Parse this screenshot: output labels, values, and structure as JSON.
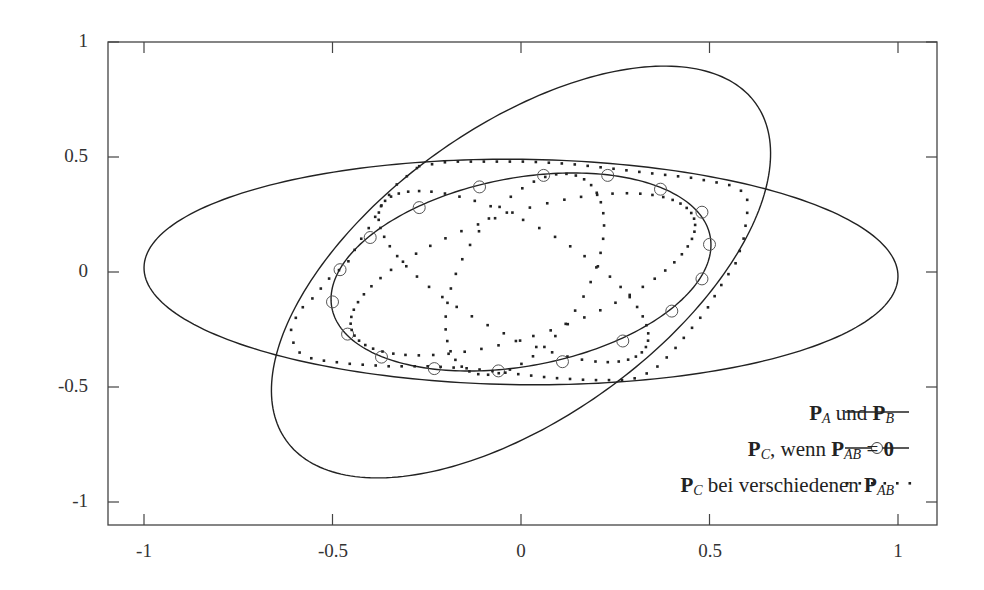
{
  "chart_data": {
    "type": "line",
    "title": "",
    "xlabel": "",
    "ylabel": "",
    "xlim": [
      -1.1,
      1.1
    ],
    "ylim": [
      -1.1,
      1.0
    ],
    "grid": false,
    "legend_position": "lower right",
    "x_ticks": [
      "-1",
      "-0.5",
      "0",
      "0.5",
      "1"
    ],
    "y_ticks": [
      "1",
      "0.5",
      "0",
      "-0.5",
      "-1"
    ],
    "legend": [
      {
        "label": "P_A und P_B",
        "style": "solid"
      },
      {
        "label": "P_C, wenn P_AB = 0",
        "style": "solid-with-circles"
      },
      {
        "label": "P_C bei verschiedenen P_AB",
        "style": "dotted"
      }
    ],
    "series": [
      {
        "name": "P_A",
        "style": "solid",
        "shape": "ellipse",
        "center": [
          0,
          0
        ],
        "semi_axes": [
          1.0,
          0.49
        ],
        "rotation_deg": -0.7
      },
      {
        "name": "P_B",
        "style": "solid",
        "shape": "ellipse",
        "center": [
          0,
          0
        ],
        "semi_axes_px": [
          289,
          145.5
        ],
        "rotation_deg": 35.7,
        "extent": {
          "x": [
            -0.66,
            0.66
          ],
          "y": [
            -0.9,
            0.89
          ]
        }
      },
      {
        "name": "P_C (P_AB = 0)",
        "style": "solid-with-circles",
        "shape": "ellipse",
        "center": [
          0,
          0
        ],
        "semi_axes_px": [
          192.5,
          94
        ],
        "rotation_deg": 10.7,
        "extent": {
          "x": [
            -0.5,
            0.5
          ],
          "y": [
            -0.44,
            0.43
          ]
        },
        "markers": [
          [
            -0.48,
            0.01
          ],
          [
            -0.5,
            -0.13
          ],
          [
            -0.46,
            -0.27
          ],
          [
            -0.37,
            -0.37
          ],
          [
            -0.23,
            -0.42
          ],
          [
            -0.06,
            -0.43
          ],
          [
            0.11,
            -0.39
          ],
          [
            0.27,
            -0.3
          ],
          [
            0.4,
            -0.17
          ],
          [
            0.48,
            -0.03
          ],
          [
            0.5,
            0.12
          ],
          [
            0.48,
            0.26
          ],
          [
            0.37,
            0.36
          ],
          [
            0.23,
            0.42
          ],
          [
            0.06,
            0.42
          ],
          [
            -0.11,
            0.37
          ],
          [
            -0.27,
            0.28
          ],
          [
            -0.4,
            0.15
          ]
        ]
      },
      {
        "name": "P_C (various P_AB) outer",
        "style": "dotted",
        "shape": "polyline",
        "points": [
          [
            -0.27,
            0.46
          ],
          [
            -0.19,
            0.48
          ],
          [
            -0.08,
            0.48
          ],
          [
            0.02,
            0.48
          ],
          [
            0.13,
            0.47
          ],
          [
            0.24,
            0.45
          ],
          [
            0.34,
            0.43
          ],
          [
            0.45,
            0.41
          ],
          [
            0.55,
            0.38
          ],
          [
            0.6,
            0.34
          ],
          [
            0.6,
            0.25
          ],
          [
            0.59,
            0.14
          ],
          [
            0.57,
            0.04
          ],
          [
            0.53,
            -0.06
          ],
          [
            0.49,
            -0.17
          ],
          [
            0.45,
            -0.25
          ],
          [
            0.4,
            -0.35
          ],
          [
            0.35,
            -0.43
          ],
          [
            0.29,
            -0.47
          ],
          [
            0.18,
            -0.47
          ],
          [
            0.08,
            -0.46
          ],
          [
            -0.03,
            -0.44
          ],
          [
            -0.13,
            -0.42
          ],
          [
            -0.24,
            -0.41
          ],
          [
            -0.35,
            -0.41
          ],
          [
            -0.45,
            -0.4
          ],
          [
            -0.55,
            -0.38
          ],
          [
            -0.6,
            -0.34
          ],
          [
            -0.61,
            -0.25
          ],
          [
            -0.59,
            -0.17
          ],
          [
            -0.55,
            -0.11
          ],
          [
            -0.51,
            -0.03
          ],
          [
            -0.46,
            0.04
          ],
          [
            -0.43,
            0.13
          ],
          [
            -0.4,
            0.2
          ],
          [
            -0.37,
            0.29
          ],
          [
            -0.33,
            0.38
          ],
          [
            -0.27,
            0.46
          ]
        ]
      },
      {
        "name": "P_C (various P_AB) inner 1",
        "style": "dotted",
        "shape": "ellipse",
        "center": [
          0.005,
          -0.01
        ],
        "semi_axes_px": [
          180,
          62
        ],
        "rotation_deg": 18
      },
      {
        "name": "P_C (various P_AB) inner 2",
        "style": "dotted",
        "shape": "ellipse",
        "center": [
          0.01,
          -0.01
        ],
        "semi_axes_px": [
          112,
          62
        ],
        "rotation_deg": 58
      },
      {
        "name": "P_C (various P_AB) inner 3",
        "style": "dotted",
        "shape": "ellipse",
        "center": [
          -0.02,
          -0.02
        ],
        "semi_axes_px": [
          150,
          55
        ],
        "rotation_deg": -28
      }
    ]
  },
  "axes": {
    "y_ticks": [
      "1",
      "0.5",
      "0",
      "-0.5",
      "-1"
    ],
    "x_ticks": [
      "-1",
      "-0.5",
      "0",
      "0.5",
      "1"
    ]
  },
  "legend": {
    "row1": {
      "p1": "P",
      "s1": "A",
      "mid": " und ",
      "p2": "P",
      "s2": "B"
    },
    "row2": {
      "p1": "P",
      "s1": "C",
      "mid": ", wenn ",
      "p2": "P",
      "s2": "AB",
      "eq": " = ",
      "zero": "0"
    },
    "row3": {
      "p1": "P",
      "s1": "C",
      "mid": " bei verschiedenen ",
      "p2": "P",
      "s2": "AB"
    }
  }
}
